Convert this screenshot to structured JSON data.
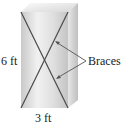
{
  "diagram": {
    "type": "braced-box-wall",
    "labels": {
      "height": "6 ft",
      "width": "3 ft",
      "callout": "Braces"
    },
    "colors": {
      "brace_line": "#4a4a4a",
      "arrow_line": "#555555",
      "face_light": "#f2f2f2",
      "face_mid": "#cfcfcf",
      "side_face": "#d9d9d9",
      "top_face": "#ececec",
      "text": "#1a1a1a"
    }
  }
}
